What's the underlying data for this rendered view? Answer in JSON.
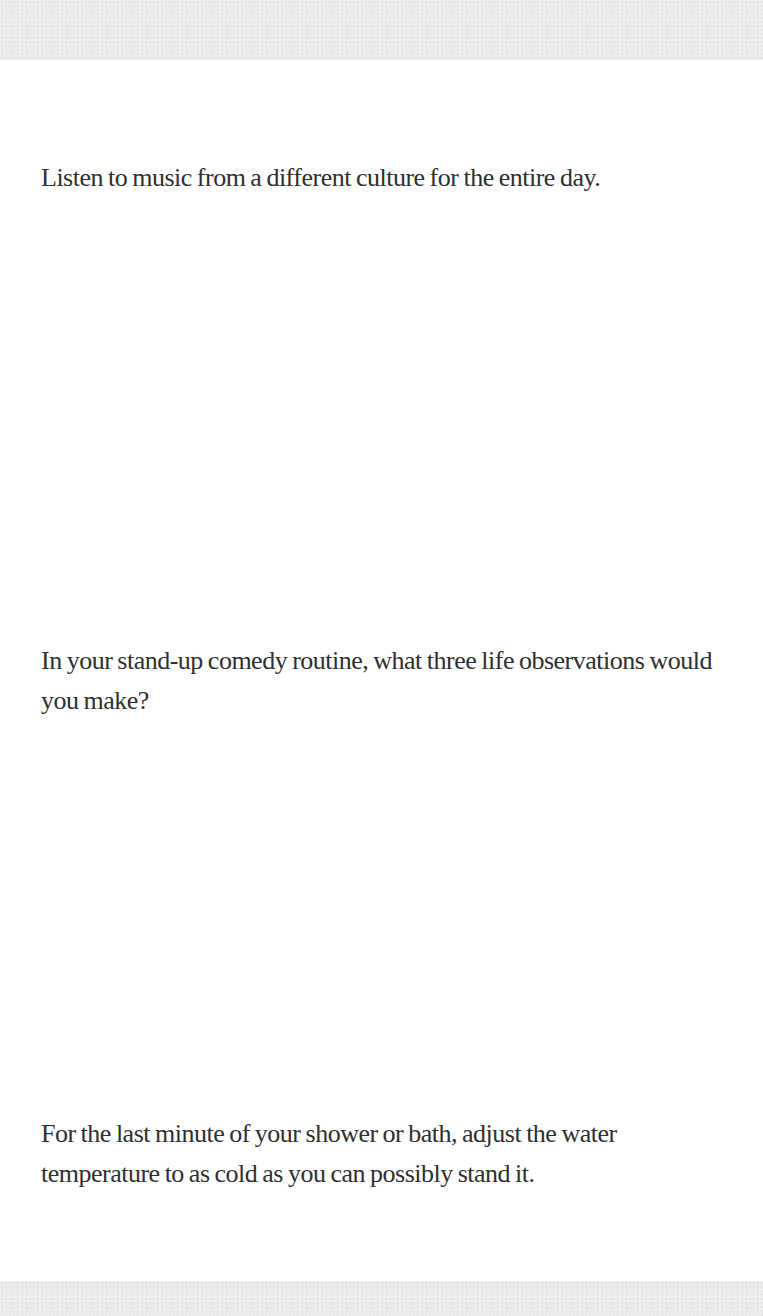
{
  "document": {
    "prompts": [
      {
        "text": "Listen to music from a different culture for the entire day."
      },
      {
        "text": "In your stand-up comedy routine, what three life observations would you make?"
      },
      {
        "text": "For the last minute of your shower or bath, adjust the water temperature to as cold as you can possibly stand it."
      }
    ]
  },
  "colors": {
    "background": "#ffffff",
    "band": "#ebebeb",
    "text": "#2f2f2f"
  }
}
